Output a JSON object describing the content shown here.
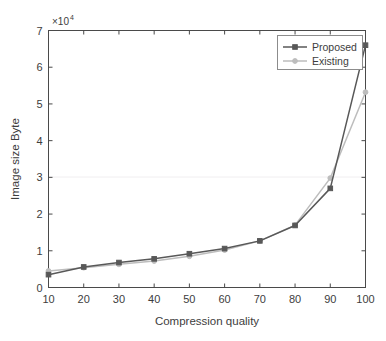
{
  "chart_data": {
    "type": "line",
    "title": "",
    "xlabel": "Compression quality",
    "ylabel": "Image size Byte",
    "y_exponent_label": "×10",
    "y_exponent_power": "4",
    "xlim": [
      10,
      100
    ],
    "ylim": [
      0,
      7
    ],
    "x": [
      10,
      20,
      30,
      40,
      50,
      60,
      70,
      80,
      90,
      100
    ],
    "xticks": [
      "10",
      "20",
      "30",
      "40",
      "50",
      "60",
      "70",
      "80",
      "90",
      "100"
    ],
    "yticks": [
      "0",
      "1",
      "2",
      "3",
      "4",
      "5",
      "6",
      "7"
    ],
    "grid": false,
    "legend_position": "top-right",
    "series": [
      {
        "name": "Proposed",
        "color": "#585858",
        "marker": "square",
        "values": [
          0.35,
          0.56,
          0.68,
          0.78,
          0.92,
          1.06,
          1.27,
          1.69,
          2.7,
          6.6
        ]
      },
      {
        "name": "Existing",
        "color": "#bdbdbd",
        "marker": "circle",
        "values": [
          0.45,
          0.54,
          0.63,
          0.72,
          0.85,
          1.02,
          1.27,
          1.7,
          2.98,
          5.32
        ]
      }
    ]
  },
  "legend": {
    "items": [
      {
        "label": "Proposed"
      },
      {
        "label": "Existing"
      }
    ]
  },
  "axes": {
    "x_title": "Compression quality",
    "y_title": "Image size Byte",
    "exponent_prefix": "×10",
    "exponent_power": "4"
  },
  "colors": {
    "proposed": "#585858",
    "existing": "#bdbdbd",
    "axis": "#4a4a4a",
    "background": "#ffffff"
  }
}
